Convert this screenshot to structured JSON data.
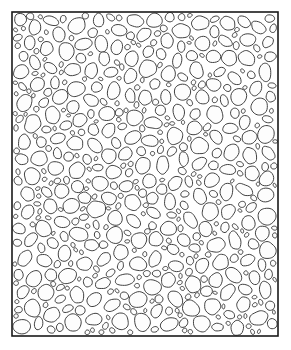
{
  "figure": {
    "name": "granular-packing-microstructure",
    "type": "diagram",
    "canvas": {
      "width": 291,
      "height": 350
    },
    "background_color": "#ffffff",
    "caption": "",
    "title": "",
    "labels": [],
    "axis_labels": [],
    "legend": []
  },
  "domain": {
    "shape": "rectangle",
    "x": 12,
    "y": 12,
    "width": 266,
    "height": 324,
    "stroke_color": "#1a1a1a",
    "stroke_width": 1.6,
    "fill_color": "none"
  },
  "grains": {
    "description": "dense random packing of irregular ellipsoidal grains",
    "fill_color": "#fdfdfd",
    "stroke_color": "#2b2b2b",
    "stroke_width": 0.9,
    "count_target": 760,
    "radius_min": 2.1,
    "radius_max": 9.2,
    "radius_mean": 4.3,
    "aspect_ratio_min": 0.62,
    "aspect_ratio_max": 1.0,
    "rotation_range_deg": [
      0,
      180
    ],
    "gap": 0.55,
    "edge_margin": 0.6,
    "vertex_count": 22,
    "shape_irregularity": 0.085,
    "seed": 20240917,
    "size_bias": {
      "large_fraction": 0.16,
      "medium_fraction": 0.34,
      "small_fraction": 0.5
    },
    "packing_fraction_estimate": 0.79
  }
}
